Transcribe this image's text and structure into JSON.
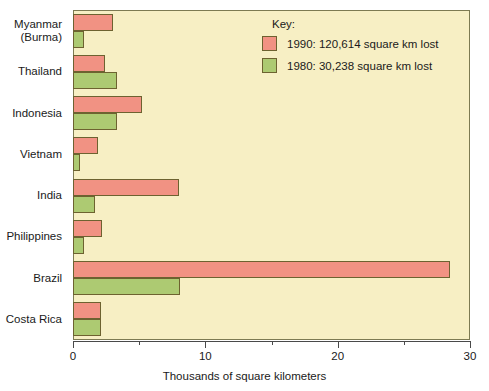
{
  "chart_data": {
    "type": "bar",
    "orientation": "horizontal",
    "title": "",
    "xlabel": "Thousands of square kilometers",
    "ylabel": "",
    "xlim": [
      0,
      30
    ],
    "xticks": [
      0,
      10,
      20,
      30
    ],
    "xticklabels": [
      "0",
      "10",
      "20",
      "30"
    ],
    "xminorticks": [
      5,
      15,
      25
    ],
    "grid": false,
    "categories": [
      "Myanmar (Burma)",
      "Thailand",
      "Indonesia",
      "Vietnam",
      "India",
      "Philippines",
      "Brazil",
      "Costa Rica"
    ],
    "category_lines": [
      [
        "Myanmar",
        "(Burma)"
      ],
      [
        "Thailand"
      ],
      [
        "Indonesia"
      ],
      [
        "Vietnam"
      ],
      [
        "India"
      ],
      [
        "Philippines"
      ],
      [
        "Brazil"
      ],
      [
        "Costa Rica"
      ]
    ],
    "series": [
      {
        "name": "1990",
        "color": "#f19283",
        "values": [
          3.0,
          2.4,
          5.2,
          1.9,
          8.0,
          2.2,
          28.5,
          2.1
        ]
      },
      {
        "name": "1980",
        "color": "#adca72",
        "values": [
          0.8,
          3.3,
          3.3,
          0.5,
          1.7,
          0.8,
          8.1,
          2.1
        ]
      }
    ],
    "legend_position": "top-right",
    "background_color": "#f7efc4",
    "frame_color": "#7d7a52"
  },
  "legend": {
    "title": "Key:",
    "entries": [
      {
        "label": "1990: 120,614 square km lost",
        "color": "#f19283"
      },
      {
        "label": "1980: 30,238 square km lost",
        "color": "#adca72"
      }
    ]
  },
  "axis": {
    "x_title": "Thousands of square kilometers",
    "x_tick_labels": [
      "0",
      "10",
      "20",
      "30"
    ]
  }
}
